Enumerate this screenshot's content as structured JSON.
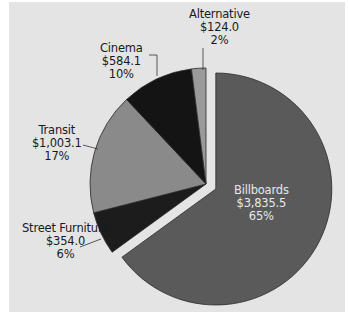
{
  "chart_data": {
    "type": "pie",
    "title": "",
    "categories": [
      "Billboards",
      "Street Furniture",
      "Transit",
      "Cinema",
      "Alternative"
    ],
    "values": [
      3835.5,
      354.0,
      1003.1,
      584.1,
      124.0
    ],
    "value_labels": [
      "$3,835.5",
      "$354.0",
      "$1,003.1",
      "$584.1",
      "$124.0"
    ],
    "percent_labels": [
      "65%",
      "6%",
      "17%",
      "10%",
      "2%"
    ],
    "percents": [
      65,
      6,
      17,
      10,
      2
    ],
    "exploded": [
      "Billboards"
    ],
    "colors": [
      "#5a5a5a",
      "#1c1c1c",
      "#8a8a8a",
      "#141414",
      "#9a9a9a"
    ],
    "legend": "none",
    "start_angle": "12 o'clock, clockwise"
  },
  "labels": {
    "billboards": {
      "name": "Billboards",
      "value": "$3,835.5",
      "pct": "65%"
    },
    "street_furniture": {
      "name": "Street Furniture",
      "value": "$354.0",
      "pct": "6%"
    },
    "transit": {
      "name": "Transit",
      "value": "$1,003.1",
      "pct": "17%"
    },
    "cinema": {
      "name": "Cinema",
      "value": "$584.1",
      "pct": "10%"
    },
    "alternative": {
      "name": "Alternative",
      "value": "$124.0",
      "pct": "2%"
    }
  },
  "colors": {
    "background": "#e4e4e4",
    "outline": "#2a2a2a",
    "gap": "#e8e8e8"
  }
}
